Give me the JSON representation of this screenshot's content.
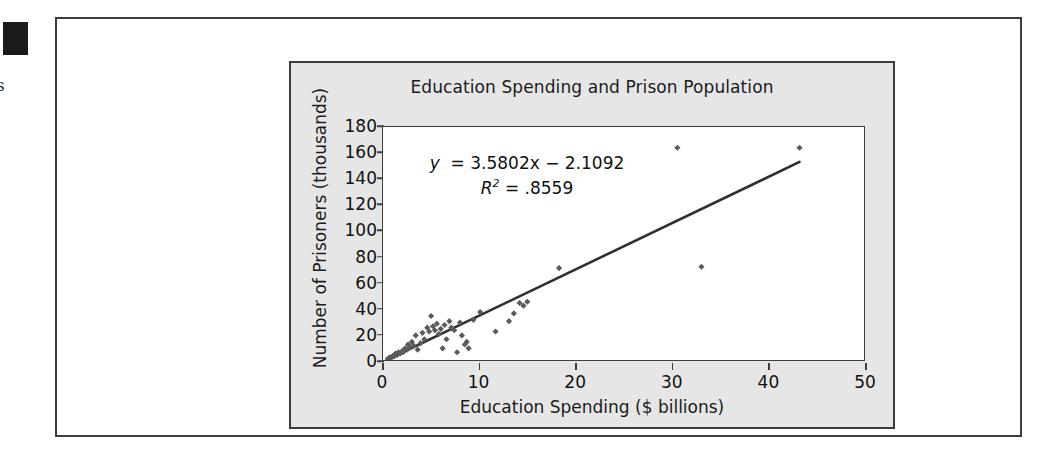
{
  "page": {
    "margin_tab": "black-tab-marker",
    "margin_glyph": "s"
  },
  "chart_data": {
    "type": "scatter",
    "title": "Education Spending and Prison Population",
    "xlabel": "Education Spending ($ billions)",
    "ylabel": "Number of Prisoners (thousands)",
    "xlim": [
      0,
      50
    ],
    "ylim": [
      0,
      180
    ],
    "xticks": [
      0,
      10,
      20,
      30,
      40,
      50
    ],
    "yticks": [
      0,
      20,
      40,
      60,
      80,
      100,
      120,
      140,
      160,
      180
    ],
    "grid": false,
    "legend": false,
    "marker_color": "#5a5a5a",
    "trendline_color": "#2f2f2f",
    "annotations": {
      "equation": "y = 3.5802x − 2.1092",
      "equation_lhs": "y",
      "equation_rhs": "= 3.5802x − 2.1092",
      "r_squared_label": "R",
      "r_squared_exp": "2",
      "r_squared_value": "= .8559",
      "slope": 3.5802,
      "intercept": -2.1092,
      "r_squared": 0.8559
    },
    "trendline": {
      "x_start": 0.4,
      "y_start": 0.0,
      "x_end": 43.3,
      "y_end": 153.0
    },
    "points": [
      {
        "x": 0.5,
        "y": 1
      },
      {
        "x": 0.7,
        "y": 2
      },
      {
        "x": 0.9,
        "y": 2
      },
      {
        "x": 1.0,
        "y": 3
      },
      {
        "x": 1.2,
        "y": 3
      },
      {
        "x": 1.3,
        "y": 5
      },
      {
        "x": 1.5,
        "y": 4
      },
      {
        "x": 1.6,
        "y": 6
      },
      {
        "x": 1.8,
        "y": 5
      },
      {
        "x": 2.0,
        "y": 7
      },
      {
        "x": 2.1,
        "y": 6
      },
      {
        "x": 2.3,
        "y": 9
      },
      {
        "x": 2.5,
        "y": 8
      },
      {
        "x": 2.6,
        "y": 12
      },
      {
        "x": 2.8,
        "y": 10
      },
      {
        "x": 3.0,
        "y": 14
      },
      {
        "x": 3.2,
        "y": 11
      },
      {
        "x": 3.4,
        "y": 19
      },
      {
        "x": 3.6,
        "y": 8
      },
      {
        "x": 3.9,
        "y": 13
      },
      {
        "x": 4.1,
        "y": 21
      },
      {
        "x": 4.3,
        "y": 16
      },
      {
        "x": 4.6,
        "y": 25
      },
      {
        "x": 4.8,
        "y": 22
      },
      {
        "x": 5.0,
        "y": 34
      },
      {
        "x": 5.2,
        "y": 26
      },
      {
        "x": 5.4,
        "y": 23
      },
      {
        "x": 5.6,
        "y": 28
      },
      {
        "x": 5.8,
        "y": 20
      },
      {
        "x": 6.0,
        "y": 24
      },
      {
        "x": 6.2,
        "y": 9
      },
      {
        "x": 6.4,
        "y": 27
      },
      {
        "x": 6.6,
        "y": 16
      },
      {
        "x": 6.9,
        "y": 30
      },
      {
        "x": 7.1,
        "y": 25
      },
      {
        "x": 7.4,
        "y": 23
      },
      {
        "x": 7.7,
        "y": 6
      },
      {
        "x": 8.0,
        "y": 29
      },
      {
        "x": 8.2,
        "y": 19
      },
      {
        "x": 8.5,
        "y": 12
      },
      {
        "x": 8.7,
        "y": 14
      },
      {
        "x": 8.9,
        "y": 9
      },
      {
        "x": 9.4,
        "y": 31
      },
      {
        "x": 10.1,
        "y": 37
      },
      {
        "x": 11.7,
        "y": 22
      },
      {
        "x": 13.1,
        "y": 30
      },
      {
        "x": 13.6,
        "y": 36
      },
      {
        "x": 14.2,
        "y": 44
      },
      {
        "x": 14.6,
        "y": 42
      },
      {
        "x": 15.0,
        "y": 45
      },
      {
        "x": 18.3,
        "y": 71
      },
      {
        "x": 30.6,
        "y": 164
      },
      {
        "x": 33.1,
        "y": 72
      },
      {
        "x": 43.3,
        "y": 164
      }
    ]
  }
}
